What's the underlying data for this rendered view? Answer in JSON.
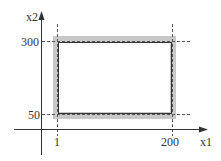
{
  "diagram": {
    "axes": {
      "x_label": "x1",
      "y_label": "x2"
    },
    "ticks": {
      "x": [
        {
          "label": "1",
          "value": 1
        },
        {
          "label": "200",
          "value": 200
        }
      ],
      "y": [
        {
          "label": "300",
          "value": 300
        },
        {
          "label": "50",
          "value": 50
        }
      ]
    },
    "region": {
      "x_min": 1,
      "x_max": 200,
      "y_min": 50,
      "y_max": 300,
      "band_color": "#c8c8c8",
      "border_color": "#333333",
      "dash_color": "#555555"
    }
  }
}
